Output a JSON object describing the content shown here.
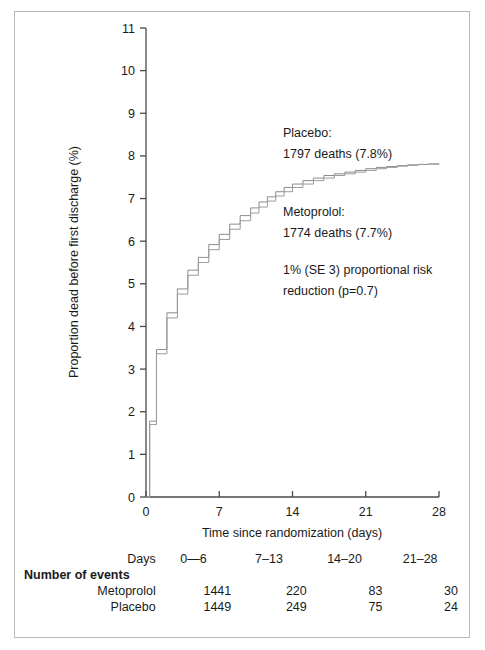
{
  "chart_data": {
    "type": "line",
    "title": "",
    "subtitle": "",
    "xlabel": "Time since randomization (days)",
    "ylabel": "Proportion dead before first discharge (%)",
    "xlim": [
      0,
      28
    ],
    "ylim": [
      0,
      11
    ],
    "xticks": [
      0,
      7,
      14,
      21,
      28
    ],
    "yticks": [
      0,
      1,
      2,
      3,
      4,
      5,
      6,
      7,
      8,
      9,
      10,
      11
    ],
    "grid": false,
    "legend_position": "in-plot-annotation",
    "step_style": "post",
    "series": [
      {
        "name": "Placebo",
        "color": "#8c8c8c",
        "deaths": 1797,
        "percent": "7.8%",
        "x": [
          0,
          0.35,
          0.7,
          1,
          1.6,
          2,
          2.6,
          3,
          3.6,
          4,
          4.6,
          5,
          5.6,
          6,
          6.6,
          7,
          7.6,
          8,
          8.6,
          9,
          9.6,
          10,
          10.8,
          11.6,
          12.4,
          13.2,
          14,
          15,
          16,
          17,
          18,
          19,
          20,
          21,
          22,
          23,
          24,
          25,
          26,
          27,
          28
        ],
        "y": [
          0,
          1.78,
          1.78,
          3.46,
          3.46,
          4.32,
          4.32,
          4.88,
          4.88,
          5.32,
          5.32,
          5.62,
          5.62,
          5.92,
          5.92,
          6.16,
          6.16,
          6.4,
          6.4,
          6.6,
          6.6,
          6.78,
          6.92,
          7.04,
          7.16,
          7.26,
          7.34,
          7.42,
          7.48,
          7.54,
          7.58,
          7.62,
          7.66,
          7.7,
          7.73,
          7.75,
          7.77,
          7.79,
          7.8,
          7.81,
          7.82
        ]
      },
      {
        "name": "Metoprolol",
        "color": "#9a9a9a",
        "deaths": 1774,
        "percent": "7.7%",
        "x": [
          0,
          0.35,
          0.7,
          1,
          1.6,
          2,
          2.6,
          3,
          3.6,
          4,
          4.6,
          5,
          5.6,
          6,
          6.6,
          7,
          7.6,
          8,
          8.6,
          9,
          9.6,
          10,
          10.8,
          11.6,
          12.4,
          13.2,
          14,
          15,
          16,
          17,
          18,
          19,
          20,
          21,
          22,
          23,
          24,
          25,
          26,
          27,
          28
        ],
        "y": [
          0,
          1.7,
          1.7,
          3.36,
          3.36,
          4.2,
          4.2,
          4.76,
          4.76,
          5.2,
          5.2,
          5.5,
          5.5,
          5.8,
          5.8,
          6.04,
          6.04,
          6.28,
          6.28,
          6.48,
          6.48,
          6.66,
          6.8,
          6.94,
          7.06,
          7.16,
          7.26,
          7.34,
          7.42,
          7.48,
          7.54,
          7.58,
          7.62,
          7.66,
          7.7,
          7.73,
          7.76,
          7.78,
          7.8,
          7.81,
          7.82
        ]
      }
    ],
    "annotations": [
      {
        "id": "placebo",
        "lines": [
          "Placebo:",
          "1797 deaths (7.8%)"
        ]
      },
      {
        "id": "metoprolol",
        "lines": [
          "Metoprolol:",
          "1774 deaths (7.7%)"
        ]
      },
      {
        "id": "risk-reduction",
        "lines": [
          "1% (SE 3) proportional risk",
          "reduction (p=0.7)"
        ]
      }
    ]
  },
  "events_table": {
    "days_row_label": "Days",
    "section_label": "Number of events",
    "columns": [
      "0—6",
      "7–13",
      "14–20",
      "21–28"
    ],
    "rows": [
      {
        "label": "Metoprolol",
        "values": [
          "1441",
          "220",
          "83",
          "30"
        ]
      },
      {
        "label": "Placebo",
        "values": [
          "1449",
          "249",
          "75",
          "24"
        ]
      }
    ]
  },
  "colors": {
    "axis": "#4a4a4a",
    "frame": "#b9b9b9",
    "placebo": "#8c8c8c",
    "metoprolol": "#9a9a9a",
    "text": "#1a1a1a"
  }
}
